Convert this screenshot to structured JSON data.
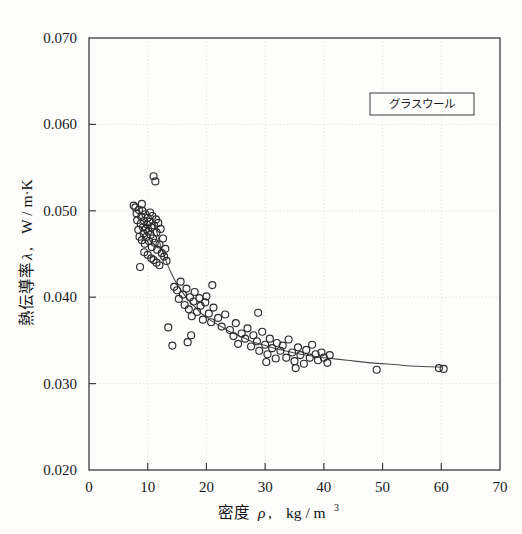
{
  "figure": {
    "background_color": "#fdfdfc",
    "frame_color": "#3c3c3c",
    "marker_color": "#2b2b2b",
    "curve_color": "#4a4a4a",
    "grid_color": "#cfcfcf"
  },
  "legend": {
    "label": "グラスウール",
    "position": "top-right"
  },
  "axis": {
    "x_title_main": "密度",
    "x_title_symbol": "ρ",
    "x_title_comma": ",",
    "x_title_unit": "kg / m",
    "x_title_exponent": "3",
    "y_title_main": "熱伝導率",
    "y_title_symbol": "λ",
    "y_title_comma": ",",
    "y_title_unit": "W / m·K"
  },
  "chart_data": {
    "type": "scatter",
    "title": "",
    "subtitle": "",
    "xlabel": "密度 ρ, kg/m³",
    "ylabel": "熱伝導率 λ, W/m·K",
    "xlim": [
      0,
      70
    ],
    "ylim": [
      0.02,
      0.07
    ],
    "xticks": [
      0,
      10,
      20,
      30,
      40,
      50,
      60,
      70
    ],
    "yticks": [
      0.02,
      0.03,
      0.04,
      0.05,
      0.06,
      0.07
    ],
    "xtick_labels": [
      "0",
      "10",
      "20",
      "30",
      "40",
      "50",
      "60",
      "70"
    ],
    "ytick_labels": [
      "0.020",
      "0.030",
      "0.040",
      "0.050",
      "0.060",
      "0.070"
    ],
    "grid": true,
    "grid_style": "dotted",
    "legend": [
      "グラスウール"
    ],
    "legend_position": "upper right",
    "marker": "open-circle",
    "marker_size": 7,
    "annotations": [],
    "series": [
      {
        "name": "グラスウール measurements",
        "type": "scatter",
        "points": [
          [
            7.6,
            0.0506
          ],
          [
            7.9,
            0.0504
          ],
          [
            8.1,
            0.0497
          ],
          [
            8.2,
            0.0489
          ],
          [
            8.4,
            0.0478
          ],
          [
            8.5,
            0.0501
          ],
          [
            8.6,
            0.047
          ],
          [
            8.8,
            0.0485
          ],
          [
            8.9,
            0.0493
          ],
          [
            9.0,
            0.0466
          ],
          [
            9.1,
            0.05
          ],
          [
            9.2,
            0.0481
          ],
          [
            9.3,
            0.0474
          ],
          [
            9.4,
            0.0488
          ],
          [
            9.5,
            0.0462
          ],
          [
            9.6,
            0.0496
          ],
          [
            9.7,
            0.0479
          ],
          [
            9.8,
            0.047
          ],
          [
            9.9,
            0.0484
          ],
          [
            10.0,
            0.0492
          ],
          [
            10.1,
            0.0476
          ],
          [
            10.2,
            0.0465
          ],
          [
            10.3,
            0.0487
          ],
          [
            10.4,
            0.0498
          ],
          [
            10.5,
            0.0472
          ],
          [
            10.6,
            0.0481
          ],
          [
            10.7,
            0.0458
          ],
          [
            10.8,
            0.0494
          ],
          [
            10.9,
            0.0468
          ],
          [
            11.0,
            0.054
          ],
          [
            11.3,
            0.0534
          ],
          [
            11.1,
            0.0483
          ],
          [
            11.2,
            0.0463
          ],
          [
            11.4,
            0.049
          ],
          [
            11.5,
            0.0475
          ],
          [
            11.6,
            0.0455
          ],
          [
            11.8,
            0.0486
          ],
          [
            12.0,
            0.0461
          ],
          [
            12.2,
            0.0479
          ],
          [
            12.4,
            0.0451
          ],
          [
            12.6,
            0.0468
          ],
          [
            12.8,
            0.0447
          ],
          [
            13.0,
            0.0456
          ],
          [
            13.2,
            0.0442
          ],
          [
            9.0,
            0.0508
          ],
          [
            9.4,
            0.0452
          ],
          [
            10.0,
            0.0449
          ],
          [
            10.6,
            0.0445
          ],
          [
            11.0,
            0.0443
          ],
          [
            11.5,
            0.044
          ],
          [
            12.0,
            0.0437
          ],
          [
            8.7,
            0.0435
          ],
          [
            13.5,
            0.0365
          ],
          [
            14.2,
            0.0344
          ],
          [
            14.5,
            0.0412
          ],
          [
            15.0,
            0.0408
          ],
          [
            15.3,
            0.0398
          ],
          [
            15.6,
            0.0418
          ],
          [
            16.0,
            0.0403
          ],
          [
            16.3,
            0.0391
          ],
          [
            16.6,
            0.041
          ],
          [
            17.0,
            0.0386
          ],
          [
            17.2,
            0.04
          ],
          [
            17.5,
            0.0378
          ],
          [
            17.8,
            0.0395
          ],
          [
            18.0,
            0.0406
          ],
          [
            18.4,
            0.0383
          ],
          [
            18.8,
            0.0399
          ],
          [
            19.0,
            0.039
          ],
          [
            19.4,
            0.0374
          ],
          [
            19.8,
            0.0394
          ],
          [
            20.0,
            0.0401
          ],
          [
            20.4,
            0.0381
          ],
          [
            20.8,
            0.0371
          ],
          [
            21.2,
            0.0388
          ],
          [
            16.8,
            0.0348
          ],
          [
            17.4,
            0.0356
          ],
          [
            21.0,
            0.0414
          ],
          [
            22.0,
            0.0376
          ],
          [
            22.6,
            0.0366
          ],
          [
            23.2,
            0.038
          ],
          [
            24.0,
            0.0362
          ],
          [
            24.6,
            0.0355
          ],
          [
            25.0,
            0.037
          ],
          [
            25.4,
            0.0346
          ],
          [
            26.0,
            0.0358
          ],
          [
            26.6,
            0.0352
          ],
          [
            27.0,
            0.0364
          ],
          [
            27.6,
            0.0343
          ],
          [
            28.0,
            0.0356
          ],
          [
            28.6,
            0.0349
          ],
          [
            29.0,
            0.0338
          ],
          [
            29.5,
            0.036
          ],
          [
            30.0,
            0.0345
          ],
          [
            30.4,
            0.0334
          ],
          [
            30.8,
            0.0352
          ],
          [
            31.2,
            0.0341
          ],
          [
            31.8,
            0.0329
          ],
          [
            32.0,
            0.0347
          ],
          [
            28.8,
            0.0382
          ],
          [
            30.2,
            0.0325
          ],
          [
            32.6,
            0.0338
          ],
          [
            33.0,
            0.0344
          ],
          [
            33.6,
            0.033
          ],
          [
            34.0,
            0.0351
          ],
          [
            34.6,
            0.0336
          ],
          [
            35.0,
            0.0326
          ],
          [
            35.6,
            0.0342
          ],
          [
            36.0,
            0.0333
          ],
          [
            36.6,
            0.0323
          ],
          [
            37.0,
            0.0339
          ],
          [
            37.6,
            0.033
          ],
          [
            38.0,
            0.0345
          ],
          [
            38.6,
            0.0334
          ],
          [
            39.0,
            0.0327
          ],
          [
            39.6,
            0.0336
          ],
          [
            40.0,
            0.033
          ],
          [
            40.6,
            0.0324
          ],
          [
            41.0,
            0.0333
          ],
          [
            35.2,
            0.0318
          ],
          [
            49.0,
            0.0316
          ],
          [
            59.6,
            0.0318
          ],
          [
            60.4,
            0.0317
          ]
        ]
      },
      {
        "name": "fitted curve",
        "type": "line",
        "points": [
          [
            11.0,
            0.049
          ],
          [
            12.0,
            0.0464
          ],
          [
            13.0,
            0.0444
          ],
          [
            14.0,
            0.0428
          ],
          [
            15.0,
            0.0415
          ],
          [
            16.0,
            0.0405
          ],
          [
            17.0,
            0.0396
          ],
          [
            18.0,
            0.0389
          ],
          [
            19.0,
            0.0382
          ],
          [
            20.0,
            0.0377
          ],
          [
            21.0,
            0.0372
          ],
          [
            22.0,
            0.0368
          ],
          [
            23.0,
            0.0364
          ],
          [
            24.0,
            0.036
          ],
          [
            25.0,
            0.0357
          ],
          [
            26.0,
            0.0354
          ],
          [
            27.0,
            0.0351
          ],
          [
            28.0,
            0.0348
          ],
          [
            29.0,
            0.0346
          ],
          [
            30.0,
            0.0344
          ],
          [
            32.0,
            0.034
          ],
          [
            34.0,
            0.0337
          ],
          [
            36.0,
            0.0334
          ],
          [
            38.0,
            0.0332
          ],
          [
            40.0,
            0.033
          ],
          [
            44.0,
            0.0327
          ],
          [
            48.0,
            0.0324
          ],
          [
            52.0,
            0.0322
          ],
          [
            56.0,
            0.032
          ],
          [
            60.0,
            0.0319
          ]
        ]
      }
    ]
  }
}
